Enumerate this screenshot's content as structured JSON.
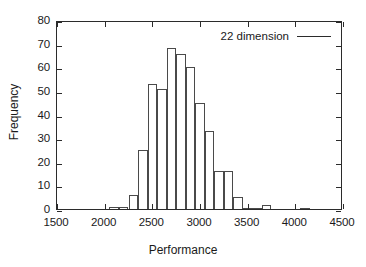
{
  "chart_data": {
    "type": "bar",
    "title": "",
    "subtitle": "",
    "xlabel": "Performance",
    "ylabel": "Frequency",
    "xlim": [
      1500,
      4500
    ],
    "ylim": [
      0,
      80
    ],
    "xticks": [
      1500,
      2000,
      2500,
      3000,
      3500,
      4000,
      4500
    ],
    "yticks": [
      0,
      10,
      20,
      30,
      40,
      50,
      60,
      70,
      80
    ],
    "grid": false,
    "legend": {
      "position": "top-right",
      "entries": [
        {
          "name": "22 dimension",
          "marker": "line"
        }
      ]
    },
    "bin_width": 100,
    "bin_starts": [
      2050,
      2150,
      2250,
      2350,
      2450,
      2550,
      2650,
      2750,
      2850,
      2950,
      3050,
      3150,
      3250,
      3350,
      3450,
      3550,
      3650,
      4050
    ],
    "categories": [
      "2050",
      "2150",
      "2250",
      "2350",
      "2450",
      "2550",
      "2650",
      "2750",
      "2850",
      "2950",
      "3050",
      "3150",
      "3250",
      "3350",
      "3450",
      "3550",
      "3650",
      "4050"
    ],
    "values": [
      1,
      1,
      6,
      25,
      53,
      51,
      68,
      65.5,
      60,
      45,
      33,
      16,
      16,
      5,
      0.5,
      0.5,
      1.5,
      0.5
    ],
    "series": [
      {
        "name": "22 dimension",
        "values": [
          1,
          1,
          6,
          25,
          53,
          51,
          68,
          65.5,
          60,
          45,
          33,
          16,
          16,
          5,
          0.5,
          0.5,
          1.5,
          0.5
        ]
      }
    ],
    "annotations": []
  },
  "axis": {
    "x_title": "Performance",
    "y_title": "Frequency",
    "x_tick_labels": [
      "1500",
      "2000",
      "2500",
      "3000",
      "3500",
      "4000",
      "4500"
    ],
    "y_tick_labels": [
      "0",
      "10",
      "20",
      "30",
      "40",
      "50",
      "60",
      "70",
      "80"
    ]
  },
  "legend": {
    "label": "22 dimension"
  }
}
